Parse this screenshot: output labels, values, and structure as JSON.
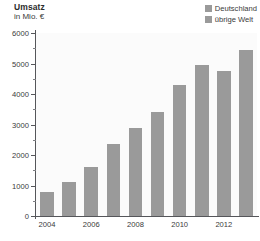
{
  "chart_data": {
    "type": "bar",
    "title": "Umsatz",
    "subtitle": "in Mio. €",
    "xlabel": "",
    "ylabel": "in Mio. €",
    "ylim": [
      0,
      6000
    ],
    "ytick_step": 1000,
    "yminor_step": 500,
    "grid": false,
    "legend_position": "top-right",
    "categories": [
      "2004",
      "2005",
      "2006",
      "2007",
      "2008",
      "2009",
      "2010",
      "2011",
      "2012",
      "2013"
    ],
    "visible_tick_labels": [
      "2004",
      "2006",
      "2008",
      "2010",
      "2012"
    ],
    "ytick_labels": [
      "6000",
      "5000",
      "4000",
      "3000",
      "2000",
      "1000",
      "0"
    ],
    "ytick_values": [
      6000,
      5000,
      4000,
      3000,
      2000,
      1000,
      0
    ],
    "yminor_values": [
      5500,
      4500,
      3500,
      2500,
      1500,
      500
    ],
    "series": [
      {
        "name": "Deutschland",
        "color": "#9a9a9a",
        "values": [
          800,
          1110,
          1600,
          2350,
          2880,
          3400,
          4280,
          4950,
          4750,
          5450
        ]
      }
    ],
    "legend": [
      {
        "label": "Deutschland",
        "color": "#9a9a9a"
      },
      {
        "label": "übrige Welt",
        "color": "#9a9a9a"
      }
    ],
    "colors": {
      "bar": "#9a9a9a",
      "axis": "#55565a",
      "text": "#3a3a3a",
      "title": "#2b2b2b",
      "plot_background": "#fbfbfb",
      "page_background": "#ffffff"
    }
  }
}
